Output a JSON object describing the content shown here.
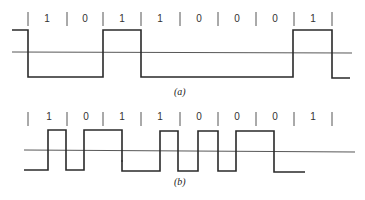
{
  "figure": {
    "panel_a": {
      "caption": "(a)",
      "bits": [
        "1",
        "0",
        "1",
        "1",
        "0",
        "0",
        "0",
        "1"
      ],
      "encoding": "NRZI-like (transition on 1)",
      "signal_levels": [
        "high",
        "low",
        "low",
        "high",
        "low",
        "low",
        "low",
        "high",
        "low"
      ]
    },
    "panel_b": {
      "caption": "(b)",
      "bits": [
        "1",
        "0",
        "1",
        "1",
        "0",
        "0",
        "0",
        "1"
      ],
      "encoding": "Manchester-like (transition mid-bit)"
    },
    "colors": {
      "line": "#2a2a2a",
      "baseline": "#444444",
      "background": "#ffffff"
    }
  }
}
